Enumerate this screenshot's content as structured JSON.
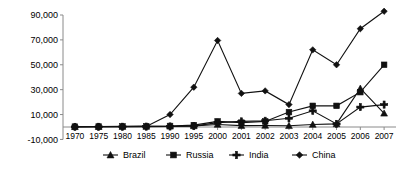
{
  "chart_data": {
    "type": "line",
    "title": "",
    "subtitle": "",
    "xlabel": "",
    "ylabel": "",
    "grid": false,
    "legend_position": "bottom",
    "categories": [
      "1970",
      "1975",
      "1980",
      "1985",
      "1990",
      "1995",
      "2000",
      "2001",
      "2002",
      "2003",
      "2004",
      "2005",
      "2006",
      "2007"
    ],
    "ylim": [
      -10000,
      90000
    ],
    "yticks": [
      -10000,
      10000,
      30000,
      50000,
      70000,
      90000
    ],
    "ytick_labels": [
      "-10,000",
      "10,000",
      "30,000",
      "50,000",
      "70,000",
      "90,000"
    ],
    "series": [
      {
        "name": "Brazil",
        "marker": "triangle",
        "color": "#111111",
        "values": [
          200,
          300,
          400,
          500,
          600,
          900,
          2000,
          1100,
          1200,
          1000,
          2000,
          2500,
          31000,
          11000
        ]
      },
      {
        "name": "Russia",
        "marker": "square",
        "color": "#111111",
        "values": [
          300,
          400,
          500,
          600,
          800,
          1500,
          4500,
          3500,
          4500,
          12000,
          17000,
          17000,
          28000,
          50000
        ]
      },
      {
        "name": "India",
        "marker": "plus",
        "color": "#111111",
        "values": [
          100,
          150,
          200,
          300,
          400,
          700,
          3500,
          4500,
          5000,
          7000,
          13000,
          2500,
          16000,
          18000
        ]
      },
      {
        "name": "China",
        "marker": "diamond",
        "color": "#111111",
        "values": [
          200,
          250,
          300,
          500,
          10000,
          32000,
          69500,
          27000,
          29000,
          18000,
          62000,
          50000,
          79000,
          93000
        ]
      }
    ]
  },
  "legend": {
    "entries": [
      {
        "label": "Brazil",
        "marker": "triangle-marker-icon"
      },
      {
        "label": "Russia",
        "marker": "square-marker-icon"
      },
      {
        "label": "India",
        "marker": "plus-marker-icon"
      },
      {
        "label": "China",
        "marker": "diamond-marker-icon"
      }
    ]
  }
}
